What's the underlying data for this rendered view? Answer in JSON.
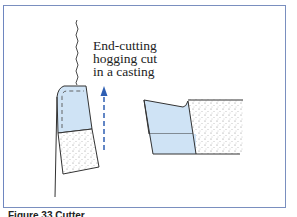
{
  "diagram": {
    "annotation": {
      "line1": "End-cutting",
      "line2": "hogging cut",
      "line3": "in a casting"
    },
    "caption": "Figure 33  Cutter",
    "colors": {
      "frame": "#7a8fbf",
      "tool_fill": "#cfe3f5",
      "arrow": "#2f5fb3",
      "outline": "#333333",
      "stipple": "#777777"
    },
    "elements": [
      {
        "name": "cutting-tool-left",
        "description": "Tool insert seen in end view, light blue with dashed cutting edge"
      },
      {
        "name": "casting-workpiece-left",
        "description": "Stippled cast material below tool"
      },
      {
        "name": "feed-arrow",
        "description": "Dashed blue upward arrow indicating feed direction"
      },
      {
        "name": "cutting-tool-right",
        "description": "Tool insert side view, light blue"
      },
      {
        "name": "casting-workpiece-right",
        "description": "Stippled cast material beside tool"
      }
    ]
  }
}
